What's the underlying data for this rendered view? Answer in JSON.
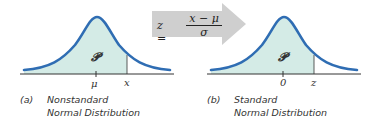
{
  "colors": {
    "curve": "#2f6db3",
    "fill": "#d4ebe6",
    "arrow": "#cfcfcf",
    "axis": "#333333"
  },
  "transform": {
    "lhs": "z =",
    "numerator": "x − μ",
    "denominator": "σ"
  },
  "panels": [
    {
      "shaded_label": "𝓟",
      "center_tick": "μ",
      "cut_tick": "x",
      "caption_letter": "(a)",
      "caption_line1": "Nonstandard",
      "caption_line2": "Normal Distribution"
    },
    {
      "shaded_label": "𝓟",
      "center_tick": "0",
      "cut_tick": "z",
      "caption_letter": "(b)",
      "caption_line1": "Standard",
      "caption_line2": "Normal Distribution"
    }
  ]
}
